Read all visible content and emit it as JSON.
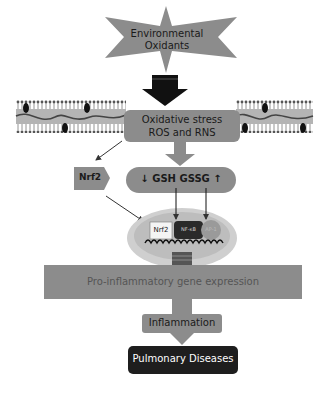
{
  "diagram": {
    "colors": {
      "shape_gray": "#8c8c8c",
      "dark_box": "#1e1e1e",
      "light_text": "#ffffff",
      "dark_text": "#222222",
      "membrane_fill": "#b4b4b4",
      "nucleus_fill": "#bdbdbd",
      "cell_fill": "#d4d4d4"
    },
    "source": {
      "line1": "Environmental",
      "line2": "Oxidants"
    },
    "oxidative_stress": {
      "line1": "Oxidative stress",
      "line2": "ROS and RNS"
    },
    "nrf2_pentagon": {
      "label": "Nrf2"
    },
    "glutathione": {
      "down_arrow": "↓",
      "label": "GSH GSSG",
      "up_arrow": "↑"
    },
    "nucleus": {
      "factors": [
        {
          "label": "Nrf2"
        },
        {
          "label": "NF-κB"
        },
        {
          "label": "AP-1"
        }
      ]
    },
    "gene_expression": {
      "label": "Pro-inflammatory gene expression"
    },
    "inflammation": {
      "label": "Inflammation"
    },
    "outcome": {
      "label": "Pulmonary Diseases"
    }
  }
}
